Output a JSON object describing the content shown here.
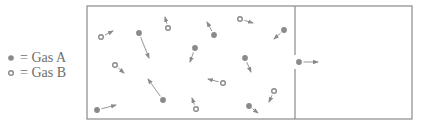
{
  "legend": {
    "items": [
      {
        "type": "A",
        "symbol": "filled-dot-icon",
        "label": "= Gas A"
      },
      {
        "type": "B",
        "symbol": "hollow-dot-icon",
        "label": "= Gas B"
      }
    ]
  },
  "colors": {
    "border": "#8a8a8a",
    "particle": "#8a8a8a",
    "text": "#6e6e6e"
  },
  "container": {
    "outer": {
      "x": 87,
      "y": 6,
      "w": 325,
      "h": 113
    },
    "divider_x": 295,
    "divider_gap": [
      55,
      69
    ]
  },
  "particles": [
    {
      "type": "B",
      "x": 101,
      "y": 37,
      "vx": 113,
      "vy": 31
    },
    {
      "type": "A",
      "x": 139,
      "y": 33,
      "vx": 149,
      "vy": 58
    },
    {
      "type": "B",
      "x": 168,
      "y": 28,
      "vx": 165,
      "vy": 17
    },
    {
      "type": "A",
      "x": 195,
      "y": 48,
      "vx": 190,
      "vy": 62
    },
    {
      "type": "B",
      "x": 115,
      "y": 65,
      "vx": 124,
      "vy": 73
    },
    {
      "type": "A",
      "x": 163,
      "y": 100,
      "vx": 148,
      "vy": 79
    },
    {
      "type": "A",
      "x": 97,
      "y": 110,
      "vx": 116,
      "vy": 105
    },
    {
      "type": "B",
      "x": 196,
      "y": 109,
      "vx": 192,
      "vy": 98
    },
    {
      "type": "A",
      "x": 214,
      "y": 35,
      "vx": 207,
      "vy": 22
    },
    {
      "type": "B",
      "x": 240,
      "y": 19,
      "vx": 253,
      "vy": 23
    },
    {
      "type": "A",
      "x": 284,
      "y": 30,
      "vx": 274,
      "vy": 39
    },
    {
      "type": "A",
      "x": 245,
      "y": 58,
      "vx": 251,
      "vy": 72
    },
    {
      "type": "B",
      "x": 223,
      "y": 83,
      "vx": 208,
      "vy": 79
    },
    {
      "type": "B",
      "x": 274,
      "y": 91,
      "vx": 269,
      "vy": 102
    },
    {
      "type": "A",
      "x": 249,
      "y": 106,
      "vx": 258,
      "vy": 113
    },
    {
      "type": "A",
      "x": 299,
      "y": 62,
      "vx": 318,
      "vy": 62
    }
  ]
}
